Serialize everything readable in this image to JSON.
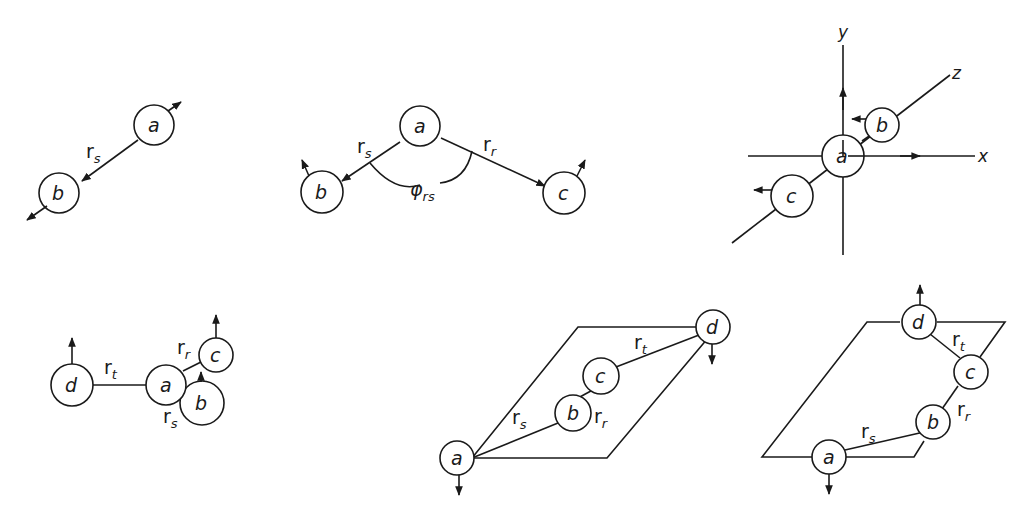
{
  "figure": {
    "panels": [
      {
        "id": "bond-stretch",
        "atoms": [
          "a",
          "b"
        ],
        "coordinate_labels": [
          {
            "main": "r",
            "sub": "s"
          }
        ]
      },
      {
        "id": "angle-bend",
        "atoms": [
          "a",
          "b",
          "c"
        ],
        "coordinate_labels": [
          {
            "main": "r",
            "sub": "s"
          },
          {
            "main": "r",
            "sub": "r"
          },
          {
            "main": "φ",
            "sub": "rs"
          }
        ]
      },
      {
        "id": "linear-bend-axes",
        "atoms": [
          "a",
          "b",
          "c"
        ],
        "axes": [
          "x",
          "y",
          "z"
        ]
      },
      {
        "id": "out-of-plane",
        "atoms": [
          "d",
          "a",
          "c",
          "b"
        ],
        "coordinate_labels": [
          {
            "main": "r",
            "sub": "t"
          },
          {
            "main": "r",
            "sub": "r"
          },
          {
            "main": "r",
            "sub": "s"
          }
        ]
      },
      {
        "id": "torsion-planar",
        "atoms": [
          "a",
          "b",
          "c",
          "d"
        ],
        "coordinate_labels": [
          {
            "main": "r",
            "sub": "s"
          },
          {
            "main": "r",
            "sub": "r"
          },
          {
            "main": "r",
            "sub": "t"
          }
        ]
      },
      {
        "id": "torsion-skew",
        "atoms": [
          "d",
          "c",
          "b",
          "a"
        ],
        "coordinate_labels": [
          {
            "main": "r",
            "sub": "t"
          },
          {
            "main": "r",
            "sub": "r"
          },
          {
            "main": "r",
            "sub": "s"
          }
        ]
      }
    ]
  },
  "labels": {
    "a": "a",
    "b": "b",
    "c": "c",
    "d": "d",
    "r": "r",
    "s": "s",
    "t": "t",
    "rr": "r",
    "rs": "rs",
    "phi": "φ",
    "x": "x",
    "y": "y",
    "z": "z"
  }
}
